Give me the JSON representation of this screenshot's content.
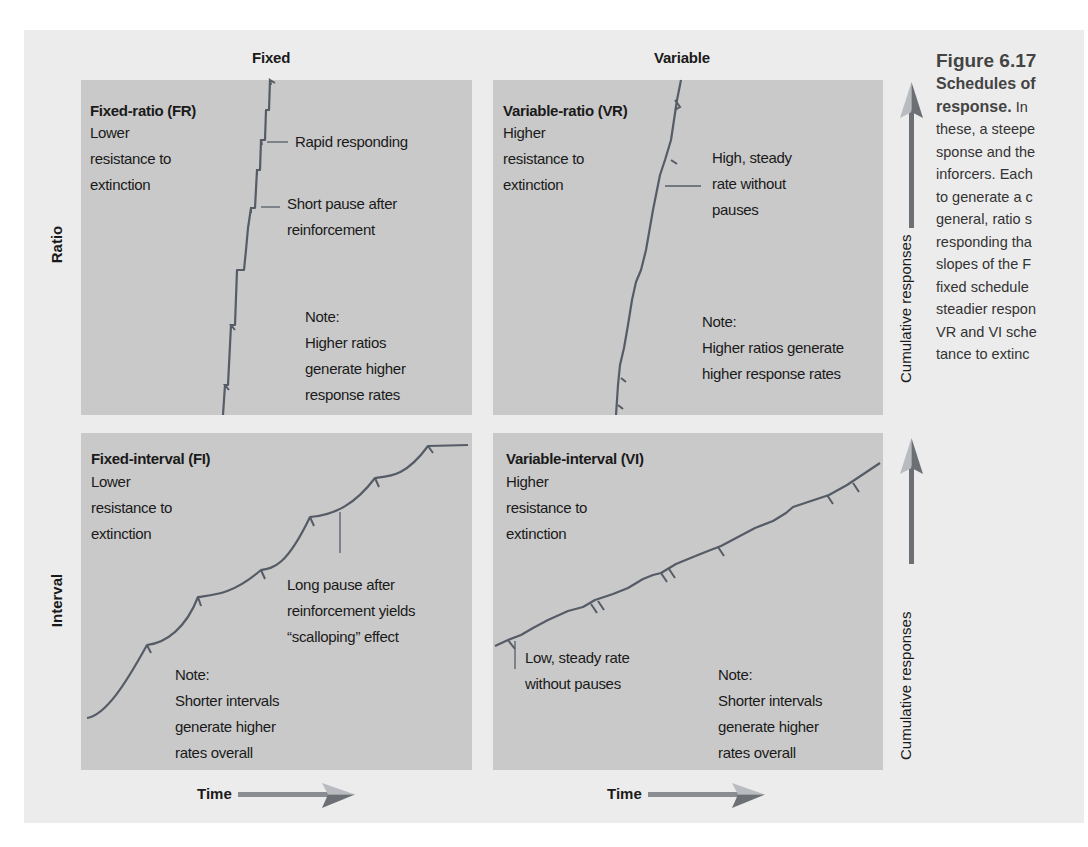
{
  "figure": {
    "number": "Figure 6.17",
    "caption_title_line1": "Schedules of",
    "caption_title_line2": "response.",
    "caption_lines": [
      "In",
      "these, a steepe",
      "sponse and the",
      "inforcers. Each",
      "to generate a c",
      "general, ratio s",
      "responding tha",
      "slopes of the F",
      "fixed schedule",
      "steadier respon",
      "VR and VI sche",
      "tance to extinc"
    ]
  },
  "columns": {
    "fixed": "Fixed",
    "variable": "Variable"
  },
  "rows": {
    "ratio": "Ratio",
    "interval": "Interval"
  },
  "axes": {
    "y_label": "Cumulative responses",
    "x_label": "Time"
  },
  "panels": {
    "fr": {
      "title": "Fixed-ratio (FR)",
      "desc": "Lower\nresistance to\nextinction",
      "annotations": [
        "Rapid responding",
        "Short pause after\nreinforcement"
      ],
      "note": "Note:\nHigher ratios\ngenerate higher\nresponse rates"
    },
    "vr": {
      "title": "Variable-ratio (VR)",
      "desc": "Higher\nresistance to\nextinction",
      "annotations": [
        "High, steady\nrate without\npauses"
      ],
      "note": "Note:\nHigher ratios generate\nhigher response rates"
    },
    "fi": {
      "title": "Fixed-interval (FI)",
      "desc": "Lower\nresistance to\nextinction",
      "annotations": [
        "Long pause after\nreinforcement yields\n“scalloping” effect"
      ],
      "note": "Note:\nShorter intervals\ngenerate higher\nrates overall"
    },
    "vi": {
      "title": "Variable-interval (VI)",
      "desc": "Higher\nresistance to\nextinction",
      "annotations": [
        "Low, steady rate\nwithout pauses"
      ],
      "note": "Note:\nShorter intervals\ngenerate higher\nrates overall"
    }
  },
  "colors": {
    "panel_bg": "#c9c9c9",
    "frame_bg": "#ececec",
    "curve": "#555c66",
    "arrow_light": "#b8bcc0",
    "arrow_dark": "#6c7075"
  }
}
